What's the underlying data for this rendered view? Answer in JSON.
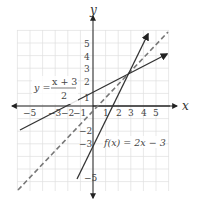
{
  "chart_data": {
    "type": "line",
    "title": "",
    "xlabel": "x",
    "ylabel": "y",
    "xlim": [
      -6,
      6
    ],
    "ylim": [
      -6.8,
      6
    ],
    "grid": true,
    "x_tick_labels": [
      "−5",
      "−3",
      "−2",
      "−1",
      "1",
      "2",
      "3",
      "4",
      "5"
    ],
    "y_tick_labels": [
      "5",
      "4",
      "3",
      "2",
      "1",
      "−2",
      "−3",
      "−5"
    ],
    "series": [
      {
        "name": "f(x) = 2x − 3",
        "style": "solid",
        "slope": 2,
        "intercept": -3,
        "x_range": [
          -1.2,
          4.4
        ]
      },
      {
        "name": "y = (x + 3)/2",
        "style": "solid",
        "slope": 0.5,
        "intercept": 1.5,
        "x_range": [
          -5.8,
          6
        ]
      },
      {
        "name": "y = x",
        "style": "dashed",
        "slope": 1,
        "intercept": 0,
        "x_range": [
          -6,
          6
        ]
      }
    ],
    "intersection": {
      "x": 3,
      "y": 3
    },
    "annotations": [
      {
        "text": "f(x) = 2x − 3",
        "position": "lower right of intersection"
      },
      {
        "text": "y = (x + 3)/2",
        "position": "left, near y=2"
      }
    ]
  },
  "labels": {
    "x_axis": "x",
    "y_axis": "y",
    "eq1_lhs": "y =",
    "eq1_num": "x + 3",
    "eq1_den": "2",
    "eq2": "f(x) = 2x − 3",
    "xt": [
      "−5",
      "−3",
      "−2",
      "−1",
      "1",
      "2",
      "3",
      "4",
      "5"
    ],
    "yt": [
      "5",
      "4",
      "3",
      "2",
      "1",
      "−2",
      "−3",
      "−5"
    ]
  },
  "colors": {
    "grid": "#dcdcdc",
    "axis": "#222222",
    "line": "#333333",
    "dashed": "#777777"
  }
}
